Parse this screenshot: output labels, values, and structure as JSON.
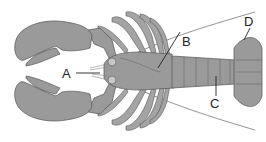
{
  "diagram": {
    "colors": {
      "body": "#9a9a9a",
      "outline": "#555555",
      "background": "#ffffff",
      "label": "#222222"
    },
    "labels": [
      {
        "id": "A",
        "text": "A",
        "points_to": "antennules / mouth region"
      },
      {
        "id": "B",
        "text": "B",
        "points_to": "cephalothorax (carapace)"
      },
      {
        "id": "C",
        "text": "C",
        "points_to": "abdomen"
      },
      {
        "id": "D",
        "text": "D",
        "points_to": "telson / tail fan"
      }
    ]
  }
}
